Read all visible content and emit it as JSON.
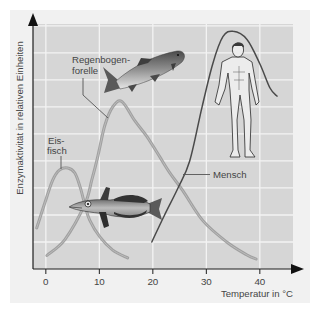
{
  "figure": {
    "y_axis_label": "Enzymaktivität in relativen Einheiten",
    "x_axis_label": "Temperatur in °C"
  },
  "annotations": {
    "trout": {
      "line1": "Regenbogen-",
      "line2": "forelle"
    },
    "icefish": {
      "line1": "Eis-",
      "line2": "fisch"
    },
    "human": {
      "line1": "Mensch"
    }
  },
  "colors": {
    "panel": "#f1f1f1",
    "plot_area": "#d6d6d6",
    "gridline": "#f3f3f3",
    "axis": "#1e1e1e",
    "fish_curves": "#9a9a9a",
    "human_curve": "#4a4a4a"
  },
  "chart_data": {
    "type": "line",
    "title": "",
    "xlabel": "Temperatur in °C",
    "ylabel": "Enzymaktivität in relativen Einheiten",
    "x_ticks": [
      0,
      10,
      20,
      30,
      40
    ],
    "y_ticks": [],
    "y_gridlines": [
      1,
      2,
      3,
      4,
      5,
      6,
      7,
      8,
      9
    ],
    "xlim": [
      -2.4,
      46.2
    ],
    "ylim": [
      0,
      9.07
    ],
    "grid": true,
    "legend": "none — inline labels with leader lines",
    "series": [
      {
        "name": "Eisfisch",
        "label": "Eis-fisch",
        "color": "#9a9a9a",
        "x": [
          -1.7,
          -0.2,
          1.3,
          2.6,
          4.1,
          5.4,
          6.4,
          7.3,
          8.2,
          10.1,
          12.5,
          15.3
        ],
        "y": [
          1.52,
          2.44,
          3.3,
          3.67,
          3.74,
          3.56,
          3.04,
          2.37,
          1.81,
          1.19,
          0.7,
          0.41
        ]
      },
      {
        "name": "Regenbogenforelle",
        "label": "Regenbogen-forelle",
        "color": "#9a9a9a",
        "x": [
          0.2,
          3.6,
          7.3,
          8.6,
          9.7,
          11.0,
          12.5,
          14.2,
          16.6,
          18.9,
          21.3,
          23.2,
          25.6,
          29.3,
          33.8,
          37.6,
          39.3
        ],
        "y": [
          0.5,
          1.1,
          2.4,
          3.3,
          4.15,
          5.3,
          6.0,
          6.2,
          5.5,
          4.9,
          4.15,
          3.55,
          2.9,
          1.8,
          1.0,
          0.52,
          0.37
        ]
      },
      {
        "name": "Mensch",
        "label": "Mensch",
        "color": "#4a4a4a",
        "x": [
          19.8,
          22.2,
          24.7,
          26.9,
          29.2,
          31.2,
          33.1,
          35.0,
          37.6,
          40.0,
          41.9,
          43.2
        ],
        "y": [
          1.0,
          2.0,
          3.0,
          4.0,
          6.0,
          7.6,
          8.6,
          8.8,
          8.5,
          7.6,
          6.7,
          6.4
        ]
      }
    ],
    "peaks": [
      {
        "series": "Eisfisch",
        "x": 4,
        "y": 3.7
      },
      {
        "series": "Regenbogenforelle",
        "x": 14,
        "y": 6.2
      },
      {
        "series": "Mensch",
        "x": 35,
        "y": 8.8
      }
    ]
  }
}
